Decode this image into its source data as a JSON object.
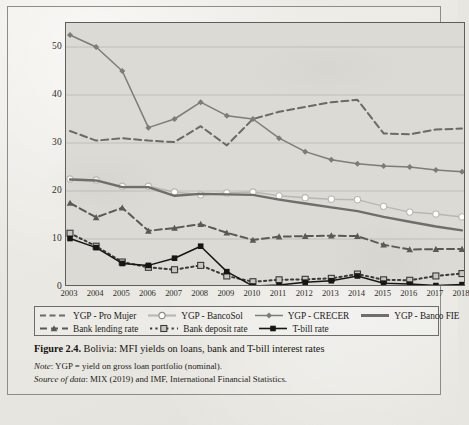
{
  "figure": {
    "number_label": "Figure 2.4.",
    "title": "Bolivia: MFI yields on loans, bank and T-bill interest rates",
    "note_label": "Note",
    "note_text": ": YGP = yield on gross loan portfolio (nominal).",
    "source_label": "Source of data",
    "source_text": ": MIX (2019) and IMF, International Financial Statistics."
  },
  "colors": {
    "plot_background": "#dcdad5",
    "paper": "#e9e7e1",
    "frame": "#5f5e5b",
    "gridline": "#b6b3ad",
    "pro_mujer": "#6b6a67",
    "bancosol": "#b9b7b2",
    "crecer": "#7d7c79",
    "banco_fie": "#6f6e6b",
    "bank_lending": "#5a5956",
    "bank_deposit": "#3a3937",
    "tbill": "#161615"
  },
  "axes": {
    "y_ticks": [
      0,
      10,
      20,
      30,
      40,
      50
    ],
    "y_min": 0,
    "y_max": 55,
    "x_ticks": [
      "2003",
      "2004",
      "2005",
      "2006",
      "2007",
      "2008",
      "2009",
      "2010",
      "2011",
      "2012",
      "2013",
      "2014",
      "2015",
      "2016",
      "2017",
      "2018"
    ],
    "grid": true
  },
  "legend": {
    "position": "below-plot",
    "row1": [
      {
        "label": "YGP - Pro Mujer",
        "marker": "dashed-line-swatch"
      },
      {
        "label": "YGP - BancoSol",
        "marker": "line-open-circle-swatch"
      },
      {
        "label": "YGP - CRECER",
        "marker": "line-diamond-swatch"
      },
      {
        "label": "YGP - Banco FIE",
        "marker": "thick-solid-line-swatch"
      }
    ],
    "row2": [
      {
        "label": "Bank lending rate",
        "marker": "dashed-triangle-swatch"
      },
      {
        "label": "Bank deposit rate",
        "marker": "dotted-open-square-swatch"
      },
      {
        "label": "T-bill rate",
        "marker": "solid-filled-square-swatch"
      }
    ]
  },
  "chart_data": {
    "type": "line",
    "title": "Bolivia: MFI yields on loans, bank and T-bill interest rates",
    "xlabel": "",
    "ylabel": "",
    "ylim": [
      0,
      55
    ],
    "grid": true,
    "legend_position": "bottom",
    "x": [
      "2003",
      "2004",
      "2005",
      "2006",
      "2007",
      "2008",
      "2009",
      "2010",
      "2011",
      "2012",
      "2013",
      "2014",
      "2015",
      "2016",
      "2017",
      "2018"
    ],
    "series": [
      {
        "name": "YGP - Pro Mujer",
        "style": "dashed",
        "marker": "none",
        "color": "#6b6a67",
        "values": [
          32.5,
          30.5,
          31.0,
          30.5,
          30.2,
          33.5,
          29.5,
          35.0,
          36.5,
          37.5,
          38.5,
          39.0,
          32.0,
          31.8,
          32.8,
          33.0
        ]
      },
      {
        "name": "YGP - BancoSol",
        "style": "solid",
        "marker": "open-circle",
        "color": "#b9b7b2",
        "values": [
          22.5,
          22.3,
          21.0,
          21.0,
          19.8,
          19.2,
          19.6,
          19.8,
          19.0,
          18.6,
          18.3,
          18.2,
          16.8,
          15.6,
          15.2,
          14.6
        ]
      },
      {
        "name": "YGP - CRECER",
        "style": "solid",
        "marker": "diamond",
        "color": "#7d7c79",
        "values": [
          52.5,
          50.0,
          45.0,
          33.2,
          35.0,
          38.5,
          35.7,
          35.0,
          31.0,
          28.2,
          26.5,
          25.7,
          25.2,
          25.0,
          24.4,
          24.0
        ]
      },
      {
        "name": "YGP - Banco FIE",
        "style": "solid-thick",
        "marker": "none",
        "color": "#6f6e6b",
        "values": [
          22.4,
          22.2,
          20.8,
          20.8,
          19.0,
          19.4,
          19.3,
          19.2,
          18.2,
          17.4,
          16.6,
          15.8,
          14.6,
          13.6,
          12.6,
          11.8
        ]
      },
      {
        "name": "Bank lending rate",
        "style": "dashed",
        "marker": "triangle",
        "color": "#5a5956",
        "values": [
          17.5,
          14.5,
          16.5,
          11.7,
          12.3,
          13.1,
          11.3,
          9.8,
          10.5,
          10.6,
          10.7,
          10.6,
          8.8,
          7.8,
          7.9,
          7.9
        ]
      },
      {
        "name": "Bank deposit rate",
        "style": "dotted",
        "marker": "open-square",
        "color": "#3a3937",
        "values": [
          11.2,
          8.5,
          5.2,
          4.1,
          3.6,
          4.5,
          2.3,
          1.1,
          1.5,
          1.6,
          1.8,
          2.7,
          1.5,
          1.4,
          2.3,
          2.8
        ]
      },
      {
        "name": "T-bill rate",
        "style": "solid",
        "marker": "filled-square",
        "color": "#161615",
        "values": [
          10.1,
          8.2,
          4.9,
          4.5,
          6.0,
          8.5,
          3.2,
          0.2,
          0.4,
          1.0,
          1.3,
          2.3,
          0.8,
          0.6,
          0.3,
          0.5
        ]
      }
    ]
  }
}
